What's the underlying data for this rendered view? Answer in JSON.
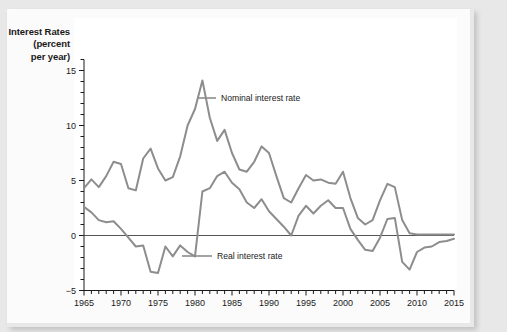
{
  "figure": {
    "y_axis_title_lines": [
      "Interest Rates",
      "(percent",
      "per year)"
    ],
    "line_color": "#8d8d8d",
    "axis_color": "#1a1a1a",
    "panel_color": "#ffffff",
    "page_color": "#e8e8e8"
  },
  "annotations": {
    "nominal": "Nominal interest rate",
    "real": "Real interest rate"
  },
  "chart_data": {
    "type": "line",
    "title": "",
    "xlabel": "",
    "ylabel": "Interest Rates (percent per year)",
    "xlim": [
      1965,
      2015
    ],
    "ylim": [
      -5,
      16
    ],
    "yticks": [
      -5,
      0,
      5,
      10,
      15
    ],
    "ytick_labels": [
      "−5",
      "0",
      "5",
      "10",
      "15"
    ],
    "y_minor_tick_step": 1,
    "xticks": [
      1965,
      1970,
      1975,
      1980,
      1985,
      1990,
      1995,
      2000,
      2005,
      2010,
      2015
    ],
    "xtick_labels": [
      "1965",
      "1970",
      "1975",
      "1980",
      "1985",
      "1990",
      "1995",
      "2000",
      "2005",
      "2010",
      "2015"
    ],
    "x_minor_tick_step": 1,
    "grid": false,
    "legend": "inline-annotations",
    "zero_line": true,
    "x": [
      1965,
      1966,
      1967,
      1968,
      1969,
      1970,
      1971,
      1972,
      1973,
      1974,
      1975,
      1976,
      1977,
      1978,
      1979,
      1980,
      1981,
      1982,
      1983,
      1984,
      1985,
      1986,
      1987,
      1988,
      1989,
      1990,
      1991,
      1992,
      1993,
      1994,
      1995,
      1996,
      1997,
      1998,
      1999,
      2000,
      2001,
      2002,
      2003,
      2004,
      2005,
      2006,
      2007,
      2008,
      2009,
      2010,
      2011,
      2012,
      2013,
      2014,
      2015
    ],
    "series": [
      {
        "name": "Nominal interest rate",
        "values": [
          4.3,
          5.1,
          4.4,
          5.4,
          6.7,
          6.5,
          4.3,
          4.1,
          7.0,
          7.9,
          6.1,
          5.0,
          5.3,
          7.2,
          10.0,
          11.5,
          14.1,
          10.7,
          8.6,
          9.6,
          7.5,
          6.0,
          5.8,
          6.7,
          8.1,
          7.5,
          5.4,
          3.4,
          3.0,
          4.3,
          5.5,
          5.0,
          5.1,
          4.8,
          4.7,
          5.8,
          3.4,
          1.6,
          1.0,
          1.4,
          3.2,
          4.7,
          4.4,
          1.4,
          0.2,
          0.1,
          0.1,
          0.1,
          0.1,
          0.1,
          0.1
        ]
      },
      {
        "name": "Real interest rate",
        "values": [
          2.6,
          2.1,
          1.4,
          1.2,
          1.3,
          0.6,
          -0.2,
          -1.0,
          -0.9,
          -3.3,
          -3.4,
          -1.0,
          -1.9,
          -0.9,
          -1.5,
          -1.9,
          4.0,
          4.3,
          5.4,
          5.8,
          4.8,
          4.2,
          3.0,
          2.5,
          3.3,
          2.2,
          1.5,
          0.8,
          0.0,
          1.8,
          2.7,
          2.0,
          2.7,
          3.2,
          2.5,
          2.5,
          0.6,
          -0.4,
          -1.3,
          -1.4,
          -0.2,
          1.5,
          1.6,
          -2.4,
          -3.1,
          -1.5,
          -1.1,
          -1.0,
          -0.6,
          -0.5,
          -0.3
        ]
      }
    ]
  }
}
